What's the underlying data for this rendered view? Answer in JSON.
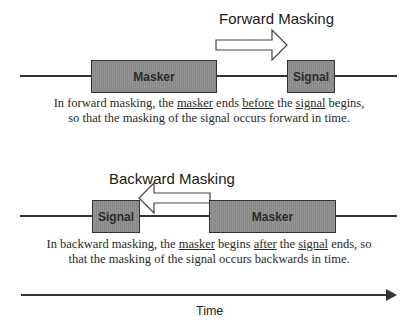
{
  "forward": {
    "title": "Forward Masking",
    "masker_label": "Masker",
    "signal_label": "Signal",
    "caption_parts": [
      "In forward masking, the ",
      "masker",
      " ends ",
      "before",
      " the ",
      "signal",
      " begins,"
    ],
    "caption_line2": "so that the masking of  the signal occurs forward in time."
  },
  "backward": {
    "title": "Backward Masking",
    "masker_label": "Masker",
    "signal_label": "Signal",
    "caption_parts": [
      "In backward masking, the ",
      "masker",
      " begins ",
      "after",
      " the ",
      "signal",
      " ends, so"
    ],
    "caption_line2": "that the masking of the signal occurs backwards in time."
  },
  "time_axis": {
    "label": "Time"
  },
  "colors": {
    "box_fill": "#8e8e8e",
    "line": "#333333",
    "text": "#1a1a1a"
  }
}
